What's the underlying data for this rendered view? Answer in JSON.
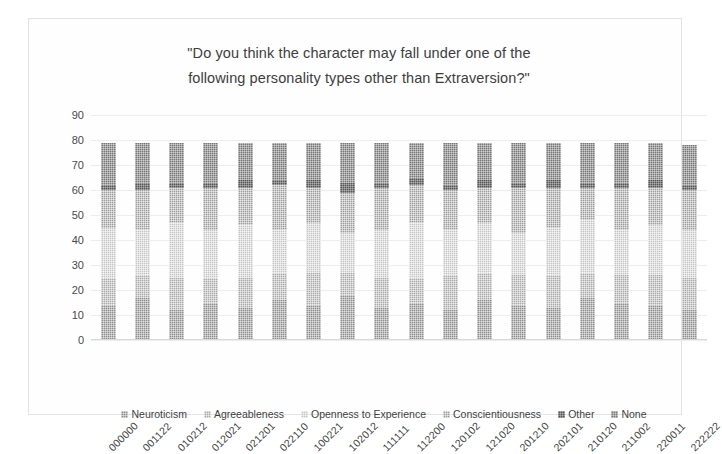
{
  "chart_data": {
    "type": "bar",
    "subtype": "stacked-column",
    "title": "\"Do you think the character may fall under one of the following personality types other than Extraversion?\"",
    "title_lines": [
      "\"Do you think the character may fall under one of the",
      "following personality types other than Extraversion?\""
    ],
    "xlabel": "",
    "ylabel": "",
    "ylim": [
      0,
      90
    ],
    "yticks": [
      0,
      10,
      20,
      30,
      40,
      50,
      60,
      70,
      80,
      90
    ],
    "grid": true,
    "legend_position": "bottom",
    "categories": [
      "000000",
      "001122",
      "010212",
      "012021",
      "021201",
      "022110",
      "100221",
      "102012",
      "111111",
      "112200",
      "120102",
      "121020",
      "201210",
      "202101",
      "210120",
      "211002",
      "220011",
      "222222"
    ],
    "series": [
      {
        "name": "Neuroticism",
        "color": "#8e8e8e",
        "values": [
          14,
          17,
          12,
          15,
          13,
          16,
          14,
          18,
          13,
          15,
          12,
          16,
          14,
          13,
          17,
          15,
          14,
          12
        ]
      },
      {
        "name": "Agreeableness",
        "color": "#a9a9a9",
        "values": [
          11,
          9,
          13,
          10,
          12,
          11,
          13,
          9,
          12,
          10,
          14,
          11,
          12,
          13,
          10,
          11,
          12,
          13
        ]
      },
      {
        "name": "Openness to Experience",
        "color": "#c4c4c4",
        "values": [
          20,
          18,
          22,
          19,
          21,
          17,
          20,
          16,
          19,
          22,
          18,
          20,
          17,
          19,
          21,
          18,
          20,
          19
        ]
      },
      {
        "name": "Conscientiousness",
        "color": "#9c9c9c",
        "values": [
          15,
          16,
          14,
          17,
          15,
          18,
          14,
          16,
          17,
          15,
          16,
          14,
          18,
          16,
          13,
          17,
          15,
          16
        ]
      },
      {
        "name": "Other",
        "color": "#565656",
        "values": [
          2,
          3,
          2,
          2,
          3,
          2,
          3,
          4,
          2,
          3,
          2,
          3,
          2,
          3,
          2,
          2,
          3,
          2
        ]
      },
      {
        "name": "None",
        "color": "#787878",
        "values": [
          17,
          16,
          16,
          16,
          15,
          15,
          15,
          16,
          16,
          14,
          17,
          15,
          16,
          15,
          16,
          16,
          15,
          16
        ]
      }
    ],
    "totals": [
      79,
      79,
      79,
      79,
      79,
      79,
      79,
      79,
      79,
      79,
      79,
      79,
      79,
      79,
      79,
      79,
      79,
      78
    ]
  },
  "legend": {
    "items": [
      {
        "label": "Neuroticism"
      },
      {
        "label": "Agreeableness"
      },
      {
        "label": "Openness to Experience"
      },
      {
        "label": "Conscientiousness"
      },
      {
        "label": "Other"
      },
      {
        "label": "None"
      }
    ]
  }
}
